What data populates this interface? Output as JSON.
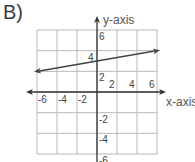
{
  "panel_label": "B)",
  "chart_data": {
    "type": "line",
    "title": "",
    "xlabel": "x-axis",
    "ylabel": "y-axis",
    "xlim": [
      -6,
      6
    ],
    "ylim": [
      -6,
      6
    ],
    "grid": true,
    "grid_step": 2,
    "x_ticks": [
      -6,
      -4,
      -2,
      2,
      4,
      6
    ],
    "y_ticks": [
      6,
      4,
      2,
      -2,
      -4,
      -6
    ],
    "x_tick_labels": [
      "-6",
      "-4",
      "-2",
      "2",
      "4",
      "6"
    ],
    "y_tick_labels": [
      "6",
      "4",
      "2",
      "-2",
      "-4",
      "-6"
    ],
    "series": [
      {
        "name": "line",
        "equation": "y = (1/6)x + 3",
        "x": [
          -6,
          6
        ],
        "y": [
          2,
          4
        ],
        "arrows_both_ends": true
      }
    ],
    "colors": {
      "grid": "#b8b8b8",
      "axis": "#333333",
      "line": "#444444"
    }
  }
}
